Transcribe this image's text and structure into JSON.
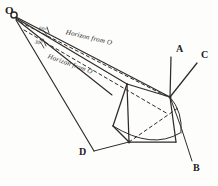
{
  "figure": {
    "kind": "perspective-construction-diagram",
    "background_color": "#fdfdfc",
    "ink_color": "#2e2b28",
    "width": 218,
    "height": 186
  },
  "station_point": {
    "name": "O",
    "label": "O",
    "x": 14,
    "y": 15
  },
  "vertices": [
    {
      "id": "A",
      "label": "A",
      "label_x": 176,
      "label_y": 50,
      "x": 170,
      "y": 60
    },
    {
      "id": "C",
      "label": "C",
      "label_x": 201,
      "label_y": 56,
      "x": 196,
      "y": 65
    },
    {
      "id": "B",
      "label": "B",
      "label_x": 194,
      "label_y": 168,
      "x": 192,
      "y": 162
    },
    {
      "id": "D",
      "label": "D",
      "label_x": 80,
      "label_y": 157,
      "x": 92,
      "y": 152
    }
  ],
  "horizon_lines": [
    {
      "id": "upper-horizon",
      "label": "Horizon from O",
      "style": "solid-with-dashed-companion",
      "label_x": 66,
      "label_y": 33,
      "rotation_deg": 13.5
    },
    {
      "id": "lower-horizon",
      "label": "Horizon from O",
      "style": "dashed",
      "label_x": 48,
      "label_y": 56,
      "rotation_deg": 20.0
    }
  ],
  "angles": [
    {
      "id": "upper-angle",
      "label": "60°",
      "label_x": 39,
      "label_y": 28,
      "rotation_deg": 13.0
    },
    {
      "id": "lower-angle",
      "label": "30°",
      "label_x": 35,
      "label_y": 41,
      "rotation_deg": 19.0
    }
  ],
  "notes": {
    "description": "Hand-drawn perspective diagram: observer point O at upper left with a fan of rays, two horizon lines labelled from O, and a quadrilateral solid with corners A, B, C, D."
  }
}
